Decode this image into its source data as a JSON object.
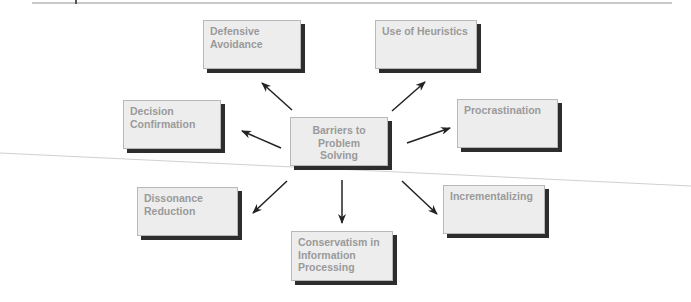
{
  "diagram": {
    "center": {
      "label": "Barriers to Problem Solving",
      "lines": [
        "Barriers to",
        "Problem",
        "Solving"
      ]
    },
    "nodes": [
      {
        "id": "defensive-avoidance",
        "lines": [
          "Defensive",
          "Avoidance"
        ]
      },
      {
        "id": "use-of-heuristics",
        "lines": [
          "Use of Heuristics"
        ]
      },
      {
        "id": "decision-confirmation",
        "lines": [
          "Decision",
          "Confirmation"
        ]
      },
      {
        "id": "procrastination",
        "lines": [
          "Procrastination"
        ]
      },
      {
        "id": "dissonance-reduction",
        "lines": [
          "Dissonance",
          "Reduction"
        ]
      },
      {
        "id": "conservatism",
        "lines": [
          "Conservatism in",
          "Information",
          "Processing"
        ]
      },
      {
        "id": "incrementalizing",
        "lines": [
          "Incrementalizing"
        ]
      }
    ],
    "colors": {
      "box_fill": "#ededed",
      "box_text": "#9a9a9a",
      "shadow": "#2d2d2d",
      "arrow": "#222222"
    }
  }
}
